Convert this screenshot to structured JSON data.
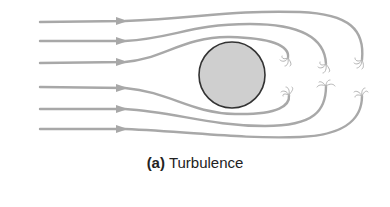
{
  "figure": {
    "caption_label": "(a)",
    "caption_text": "Turbulence"
  },
  "colors": {
    "streamline": "#a8a8a8",
    "obstacle_fill": "#cfcfcf",
    "obstacle_stroke": "#333333",
    "caption": "#222222"
  },
  "diagram": {
    "streamline_count": 6,
    "obstacle": "circle",
    "eddy_count": 6
  }
}
